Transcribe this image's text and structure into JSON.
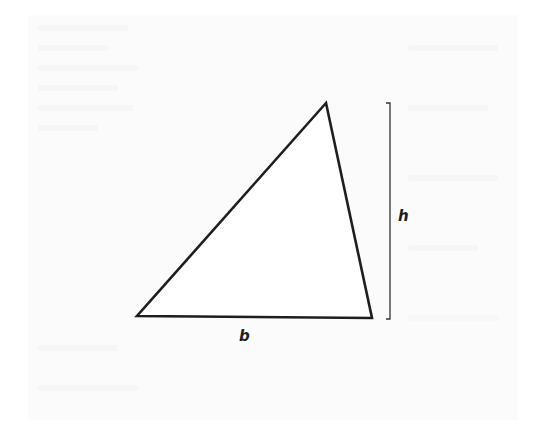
{
  "diagram": {
    "shape": "triangle",
    "vertices": {
      "apex": [
        326,
        103
      ],
      "bottom_left": [
        137,
        316
      ],
      "bottom_right": [
        372,
        318
      ]
    },
    "height_bracket": {
      "x": 390,
      "top": 103,
      "bottom": 319,
      "tick_length": 4
    },
    "labels": {
      "base": "b",
      "height": "h"
    },
    "colors": {
      "stroke": "#1e1e1e",
      "background": "#ffffff",
      "page_tint": "#fbfbfb"
    }
  }
}
